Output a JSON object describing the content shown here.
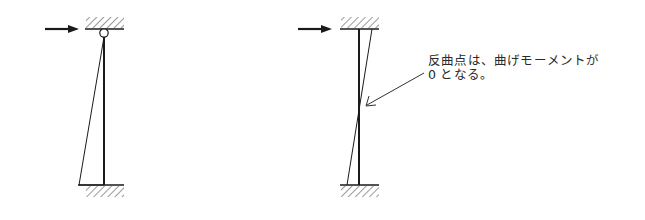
{
  "figure": {
    "colors": {
      "stroke": "#1a1a1a",
      "hatch": "#555555",
      "background": "#ffffff",
      "text": "#2a2a2a"
    },
    "left_diagram": {
      "support_top": "pin-with-fixed-hatch",
      "support_bottom": "fixed",
      "load": "horizontal-arrow-at-top",
      "moment_shape": "triangle (zero at top pin, max at base)"
    },
    "right_diagram": {
      "support_top": "fixed",
      "support_bottom": "fixed",
      "load": "horizontal-arrow-at-top",
      "moment_shape": "anti-symmetric line crossing the column at the inflection point"
    },
    "annotation": {
      "line1": "反曲点は、曲げモーメントが",
      "line2": "0 となる。"
    }
  }
}
